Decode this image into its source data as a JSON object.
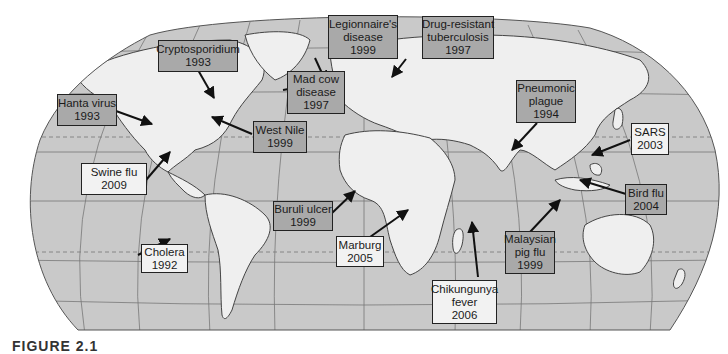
{
  "map": {
    "projection": "Robinson-style world map",
    "colors": {
      "ocean": "#c8c8c8",
      "land": "#efefef",
      "outline": "#555555",
      "dark_label_fill": "#a9a9a9",
      "light_label_fill": "#f2f2f2",
      "label_border": "#222222"
    },
    "outbreaks": [
      {
        "id": "hanta",
        "lines": [
          "Hanta virus",
          "1993"
        ],
        "style": "dark"
      },
      {
        "id": "cryptosporidium",
        "lines": [
          "Cryptosporidium",
          "1993"
        ],
        "style": "dark"
      },
      {
        "id": "mad-cow",
        "lines": [
          "Mad cow",
          "disease",
          "1997"
        ],
        "style": "dark"
      },
      {
        "id": "legionnaires",
        "lines": [
          "Legionnaire's",
          "disease",
          "1999"
        ],
        "style": "dark"
      },
      {
        "id": "drug-resistant-tb",
        "lines": [
          "Drug-resistant",
          "tuberculosis",
          "1997"
        ],
        "style": "dark"
      },
      {
        "id": "pneumonic-plague",
        "lines": [
          "Pneumonic",
          "plague",
          "1994"
        ],
        "style": "dark"
      },
      {
        "id": "west-nile",
        "lines": [
          "West Nile",
          "1999"
        ],
        "style": "dark"
      },
      {
        "id": "sars",
        "lines": [
          "SARS",
          "2003"
        ],
        "style": "light"
      },
      {
        "id": "swine-flu",
        "lines": [
          "Swine flu",
          "2009"
        ],
        "style": "light"
      },
      {
        "id": "bird-flu",
        "lines": [
          "Bird flu",
          "2004"
        ],
        "style": "dark"
      },
      {
        "id": "buruli-ulcer",
        "lines": [
          "Buruli ulcer",
          "1999"
        ],
        "style": "dark"
      },
      {
        "id": "cholera",
        "lines": [
          "Cholera",
          "1992"
        ],
        "style": "light"
      },
      {
        "id": "marburg",
        "lines": [
          "Marburg",
          "2005"
        ],
        "style": "light"
      },
      {
        "id": "malaysian-pig-flu",
        "lines": [
          "Malaysian",
          "pig flu",
          "1999"
        ],
        "style": "dark"
      },
      {
        "id": "chikungunya",
        "lines": [
          "Chikungunya",
          "fever",
          "2006"
        ],
        "style": "light"
      }
    ]
  },
  "caption": "FIGURE 2.1"
}
